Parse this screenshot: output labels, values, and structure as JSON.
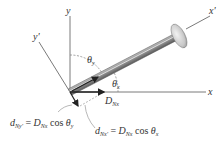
{
  "diagram": {
    "axes": {
      "x": "x",
      "y": "y",
      "x_prime": "x'",
      "y_prime": "y'"
    },
    "angles": {
      "theta_y": "θ",
      "theta_y_sub": "y",
      "theta_x": "θ",
      "theta_x_sub": "x"
    },
    "force": {
      "symbol": "D",
      "sub": "Nx"
    },
    "equations": [
      {
        "lhs": "d",
        "lhs_sub": "Ny'",
        "eq": " = ",
        "rhs": "D",
        "rhs_sub": "Nx",
        "func": " cos ",
        "theta": "θ",
        "theta_sub": "y"
      },
      {
        "lhs": "d",
        "lhs_sub": "Nx'",
        "eq": " = ",
        "rhs": "D",
        "rhs_sub": "Nx",
        "func": " cos ",
        "theta": "θ",
        "theta_sub": "x"
      }
    ],
    "colors": {
      "axis": "#7a7a7a",
      "rod": "#8c8c8c",
      "rod_dark": "#555555",
      "head": "#cfcfcf",
      "text": "#333333"
    }
  }
}
